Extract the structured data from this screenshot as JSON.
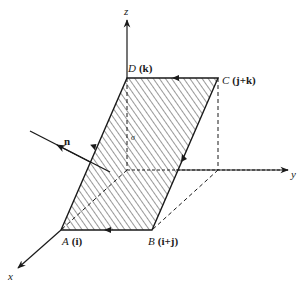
{
  "figure": {
    "type": "3d-coordinate-diagram",
    "axes": {
      "x": {
        "label": "x"
      },
      "y": {
        "label": "y"
      },
      "z": {
        "label": "z"
      }
    },
    "vertices": [
      {
        "id": "A",
        "name": "A",
        "vector": "(i)"
      },
      {
        "id": "B",
        "name": "B",
        "vector": "(i+j)"
      },
      {
        "id": "C",
        "name": "C",
        "vector": "(j+k)"
      },
      {
        "id": "D",
        "name": "D",
        "vector": "(k)"
      }
    ],
    "normal": {
      "label": "n"
    },
    "surface": {
      "label": "σ",
      "fill": "hatched"
    },
    "edges_orientation": [
      "A→B",
      "B→C",
      "C→D",
      "D→A"
    ],
    "colors": {
      "ink": "#1a1a1a",
      "background": "#ffffff"
    }
  }
}
